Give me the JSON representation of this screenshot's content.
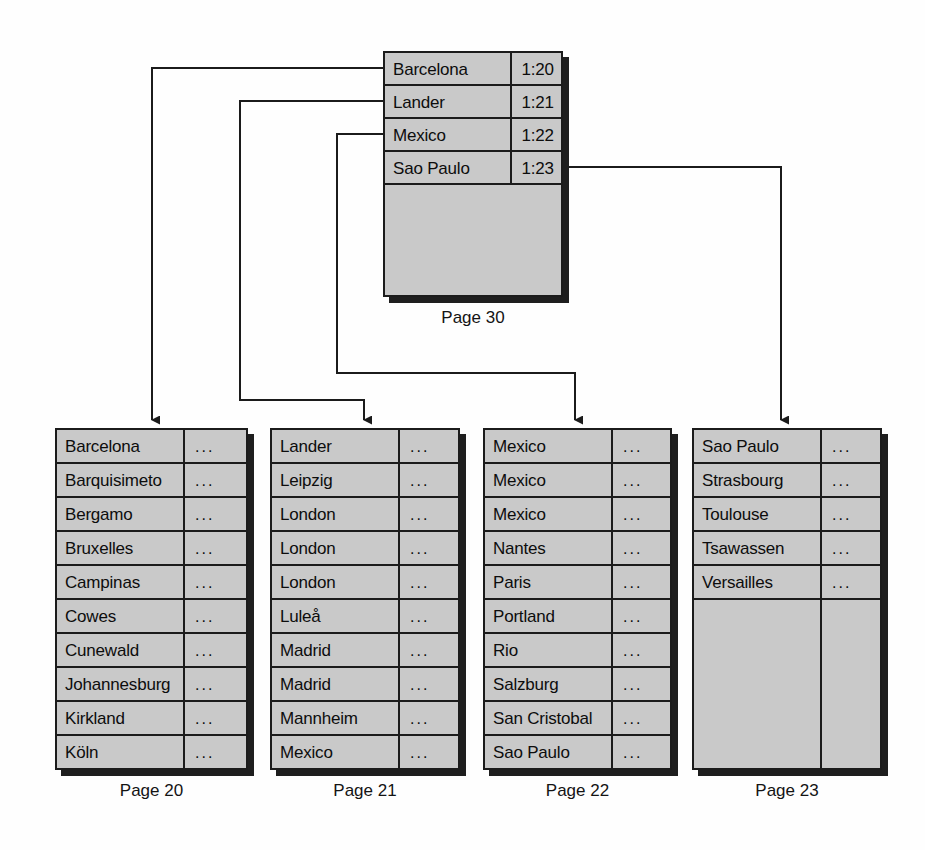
{
  "diagram": {
    "index_page": {
      "caption": "Page 30",
      "rows": [
        {
          "key": "Barcelona",
          "value": "1:20"
        },
        {
          "key": "Lander",
          "value": "1:21"
        },
        {
          "key": "Mexico",
          "value": "1:22"
        },
        {
          "key": "Sao Paulo",
          "value": "1:23"
        }
      ],
      "empty_rows": 4
    },
    "leaf_pages": [
      {
        "caption": "Page 20",
        "rows": [
          {
            "key": "Barcelona",
            "value": "..."
          },
          {
            "key": "Barquisimeto",
            "value": "..."
          },
          {
            "key": "Bergamo",
            "value": "..."
          },
          {
            "key": "Bruxelles",
            "value": "..."
          },
          {
            "key": "Campinas",
            "value": "..."
          },
          {
            "key": "Cowes",
            "value": "..."
          },
          {
            "key": "Cunewald",
            "value": "..."
          },
          {
            "key": "Johannesburg",
            "value": "..."
          },
          {
            "key": "Kirkland",
            "value": "..."
          },
          {
            "key": "Köln",
            "value": "..."
          }
        ],
        "empty_rows": 0
      },
      {
        "caption": "Page 21",
        "rows": [
          {
            "key": "Lander",
            "value": "..."
          },
          {
            "key": "Leipzig",
            "value": "..."
          },
          {
            "key": "London",
            "value": "..."
          },
          {
            "key": "London",
            "value": "..."
          },
          {
            "key": "London",
            "value": "..."
          },
          {
            "key": "Luleå",
            "value": "..."
          },
          {
            "key": "Madrid",
            "value": "..."
          },
          {
            "key": "Madrid",
            "value": "..."
          },
          {
            "key": "Mannheim",
            "value": "..."
          },
          {
            "key": "Mexico",
            "value": "..."
          }
        ],
        "empty_rows": 0
      },
      {
        "caption": "Page 22",
        "rows": [
          {
            "key": "Mexico",
            "value": "..."
          },
          {
            "key": "Mexico",
            "value": "..."
          },
          {
            "key": "Mexico",
            "value": "..."
          },
          {
            "key": "Nantes",
            "value": "..."
          },
          {
            "key": "Paris",
            "value": "..."
          },
          {
            "key": "Portland",
            "value": "..."
          },
          {
            "key": "Rio",
            "value": "..."
          },
          {
            "key": "Salzburg",
            "value": "..."
          },
          {
            "key": "San Cristobal",
            "value": "..."
          },
          {
            "key": "Sao Paulo",
            "value": "..."
          }
        ],
        "empty_rows": 0
      },
      {
        "caption": "Page 23",
        "rows": [
          {
            "key": "Sao Paulo",
            "value": "..."
          },
          {
            "key": "Strasbourg",
            "value": "..."
          },
          {
            "key": "Toulouse",
            "value": "..."
          },
          {
            "key": "Tsawassen",
            "value": "..."
          },
          {
            "key": "Versailles",
            "value": "..."
          }
        ],
        "empty_rows": 5
      }
    ],
    "connections": [
      {
        "from": "Barcelona",
        "to": "Page 20"
      },
      {
        "from": "Lander",
        "to": "Page 21"
      },
      {
        "from": "Mexico",
        "to": "Page 22"
      },
      {
        "from": "Sao Paulo",
        "to": "Page 23"
      }
    ],
    "colors": {
      "cell_fill": "#c9c9c9",
      "border": "#1b1b1b",
      "shadow": "#1e1e1e",
      "text": "#0d0d0d",
      "background": "#ffffff"
    }
  }
}
